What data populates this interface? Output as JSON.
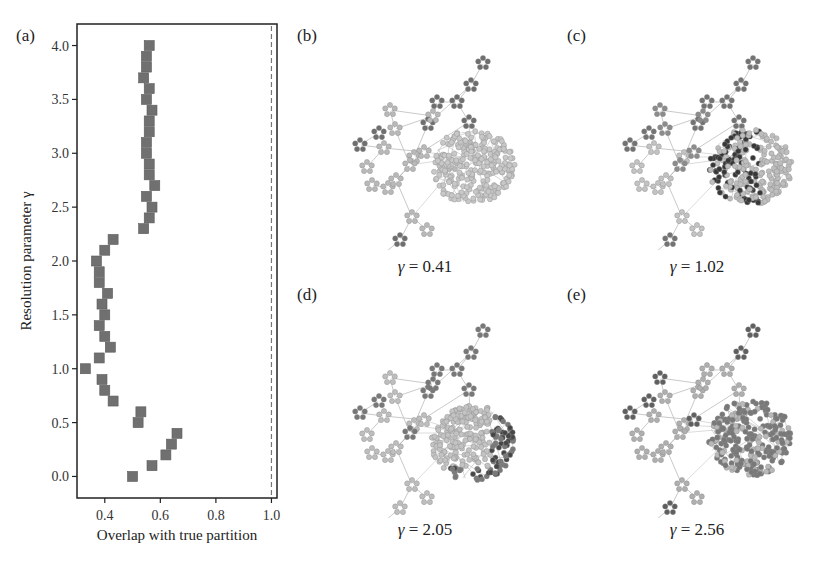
{
  "panels": {
    "a": {
      "label": "(a)"
    },
    "b": {
      "label": "(b)",
      "gamma_text": "= 0.41",
      "gamma": 0.41
    },
    "c": {
      "label": "(c)",
      "gamma_text": "= 1.02",
      "gamma": 1.02
    },
    "d": {
      "label": "(d)",
      "gamma_text": "= 2.05",
      "gamma": 2.05
    },
    "e": {
      "label": "(e)",
      "gamma_text": "= 2.56",
      "gamma": 2.56
    }
  },
  "gamma_symbol": "γ",
  "chart_data": {
    "type": "scatter",
    "title": "",
    "xlabel": "Overlap with true partition",
    "ylabel": "Resolution parameter γ",
    "xlim": [
      0.3,
      1.02
    ],
    "ylim": [
      -0.2,
      4.2
    ],
    "xticks": [
      0.4,
      0.6,
      0.8,
      1.0
    ],
    "xtick_labels": [
      "0.4",
      "0.6",
      "0.8",
      "1.0"
    ],
    "yticks": [
      0.0,
      0.5,
      1.0,
      1.5,
      2.0,
      2.5,
      3.0,
      3.5,
      4.0
    ],
    "ytick_labels": [
      "0.0",
      "0.5",
      "1.0",
      "1.5",
      "2.0",
      "2.5",
      "3.0",
      "3.5",
      "4.0"
    ],
    "grid": false,
    "reference_line": {
      "x": 1.0,
      "style": "dashed"
    },
    "marker": "square",
    "marker_color": "#707070",
    "series": [
      {
        "name": "overlap",
        "x": [
          0.5,
          0.57,
          0.62,
          0.64,
          0.66,
          0.52,
          0.53,
          0.43,
          0.4,
          0.39,
          0.33,
          0.38,
          0.42,
          0.4,
          0.38,
          0.4,
          0.39,
          0.41,
          0.38,
          0.38,
          0.37,
          0.4,
          0.43,
          0.54,
          0.56,
          0.57,
          0.55,
          0.58,
          0.56,
          0.56,
          0.55,
          0.55,
          0.56,
          0.56,
          0.57,
          0.55,
          0.56,
          0.54,
          0.55,
          0.55,
          0.56
        ],
        "y": [
          0.0,
          0.1,
          0.2,
          0.3,
          0.4,
          0.5,
          0.6,
          0.7,
          0.8,
          0.9,
          1.0,
          1.1,
          1.2,
          1.3,
          1.4,
          1.5,
          1.6,
          1.7,
          1.8,
          1.9,
          2.0,
          2.1,
          2.2,
          2.3,
          2.4,
          2.5,
          2.6,
          2.7,
          2.8,
          2.9,
          3.0,
          3.1,
          3.2,
          3.3,
          3.4,
          3.5,
          3.6,
          3.7,
          3.8,
          3.9,
          4.0
        ]
      }
    ]
  }
}
